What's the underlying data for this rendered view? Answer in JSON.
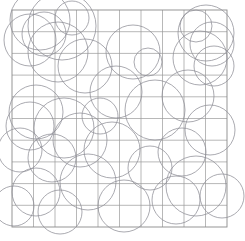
{
  "figure": {
    "background_color": "#ffffff",
    "width": 245,
    "height": 241
  },
  "chart_data": {
    "type": "scatter",
    "subtitle": "",
    "xlabel": "",
    "ylabel": "",
    "grid": true,
    "legend": false,
    "legend_position": "none",
    "xlim": [
      12,
      227
    ],
    "ylim": [
      10,
      227
    ],
    "grid_spec": {
      "x_start": 12,
      "y_start": 10,
      "x_end": 227,
      "y_end": 227,
      "columns": 10,
      "rows": 10,
      "cell_width": 21.5,
      "cell_height": 21.7,
      "line_color": "#9a9a9a",
      "line_width": 0.7,
      "border_color": "#8a8a8a",
      "border_width": 0.9
    },
    "circle_style": {
      "stroke_color": "#8d8d95",
      "stroke_width": 0.75,
      "fill": "none"
    },
    "circles": [
      {
        "cx": 40,
        "cy": 20,
        "r": 30
      },
      {
        "cx": 44,
        "cy": 34,
        "r": 22
      },
      {
        "cx": 62,
        "cy": 26,
        "r": 34
      },
      {
        "cx": 30,
        "cy": 40,
        "r": 26
      },
      {
        "cx": 72,
        "cy": 18,
        "r": 17
      },
      {
        "cx": 58,
        "cy": 52,
        "r": 30
      },
      {
        "cx": 133,
        "cy": 52,
        "r": 27
      },
      {
        "cx": 85,
        "cy": 66,
        "r": 27
      },
      {
        "cx": 206,
        "cy": 33,
        "r": 28
      },
      {
        "cx": 212,
        "cy": 44,
        "r": 22
      },
      {
        "cx": 200,
        "cy": 58,
        "r": 27
      },
      {
        "cx": 214,
        "cy": 66,
        "r": 20
      },
      {
        "cx": 196,
        "cy": 26,
        "r": 16
      },
      {
        "cx": 116,
        "cy": 92,
        "r": 26
      },
      {
        "cx": 188,
        "cy": 96,
        "r": 26
      },
      {
        "cx": 155,
        "cy": 110,
        "r": 30
      },
      {
        "cx": 36,
        "cy": 112,
        "r": 27
      },
      {
        "cx": 30,
        "cy": 126,
        "r": 24
      },
      {
        "cx": 64,
        "cy": 128,
        "r": 30
      },
      {
        "cx": 80,
        "cy": 140,
        "r": 27
      },
      {
        "cx": 20,
        "cy": 150,
        "r": 22
      },
      {
        "cx": 112,
        "cy": 150,
        "r": 28
      },
      {
        "cx": 52,
        "cy": 158,
        "r": 24
      },
      {
        "cx": 210,
        "cy": 130,
        "r": 25
      },
      {
        "cx": 182,
        "cy": 152,
        "r": 24
      },
      {
        "cx": 150,
        "cy": 168,
        "r": 22
      },
      {
        "cx": 88,
        "cy": 182,
        "r": 28
      },
      {
        "cx": 36,
        "cy": 192,
        "r": 24
      },
      {
        "cx": 196,
        "cy": 186,
        "r": 30
      },
      {
        "cx": 176,
        "cy": 200,
        "r": 24
      },
      {
        "cx": 222,
        "cy": 196,
        "r": 22
      },
      {
        "cx": 124,
        "cy": 206,
        "r": 26
      },
      {
        "cx": 60,
        "cy": 212,
        "r": 22
      },
      {
        "cx": 14,
        "cy": 206,
        "r": 20
      },
      {
        "cx": 148,
        "cy": 62,
        "r": 14
      },
      {
        "cx": 100,
        "cy": 116,
        "r": 18
      }
    ]
  }
}
